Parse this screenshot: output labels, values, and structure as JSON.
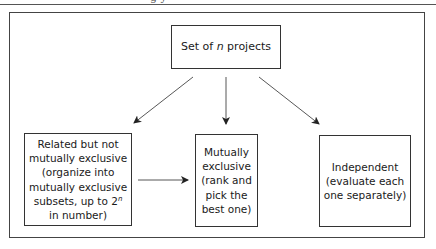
{
  "header": {
    "cut_text": "g y"
  },
  "diagram": {
    "root": {
      "prefix": "Set of ",
      "variable": "n",
      "suffix": " projects"
    },
    "nodes": {
      "related": {
        "lines": [
          "Related but not",
          "mutually exclusive",
          "(organize into",
          "mutually exclusive",
          "subsets, up to 2"
        ],
        "superscript": "n",
        "last_line": "in number)"
      },
      "mutually_exclusive": {
        "lines": [
          "Mutually",
          "exclusive",
          "(rank and",
          "pick the",
          "best one)"
        ]
      },
      "independent": {
        "lines": [
          "Independent",
          "(evaluate each",
          "one separately)"
        ]
      }
    },
    "edges": [
      {
        "from": "root",
        "to": "related"
      },
      {
        "from": "root",
        "to": "mutually_exclusive"
      },
      {
        "from": "root",
        "to": "independent"
      },
      {
        "from": "related",
        "to": "mutually_exclusive"
      }
    ],
    "colors": {
      "line": "#333333",
      "background": "#ffffff"
    }
  }
}
